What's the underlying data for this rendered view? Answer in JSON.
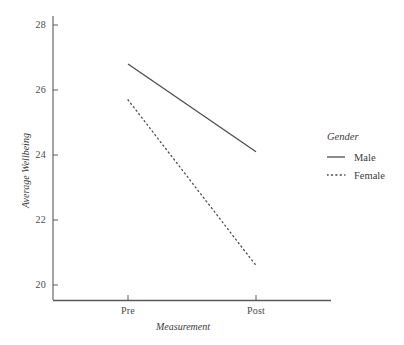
{
  "chart_data": {
    "type": "line",
    "title": "",
    "xlabel": "Measurement",
    "ylabel": "Average Wellbeing",
    "categories": [
      "Pre",
      "Post"
    ],
    "x_tick_labels": [
      "Pre",
      "Post"
    ],
    "y_tick_labels": [
      "20",
      "22",
      "24",
      "26",
      "28"
    ],
    "ylim": [
      19.6,
      28.4
    ],
    "yticks": [
      20,
      22,
      24,
      26,
      28
    ],
    "grid": false,
    "legend_position": "right",
    "legend_title": "Gender",
    "series": [
      {
        "name": "Male",
        "linestyle": "solid",
        "color": "#4d4d4d",
        "values": [
          26.8,
          24.1
        ]
      },
      {
        "name": "Female",
        "linestyle": "dotted",
        "color": "#4d4d4d",
        "values": [
          25.7,
          20.6
        ]
      }
    ]
  },
  "axes": {
    "y_label": "Average Wellbeing",
    "x_label": "Measurement",
    "y_ticks": [
      {
        "label": "28",
        "value": 28
      },
      {
        "label": "26",
        "value": 26
      },
      {
        "label": "24",
        "value": 24
      },
      {
        "label": "22",
        "value": 22
      },
      {
        "label": "20",
        "value": 20
      }
    ],
    "x_ticks": [
      {
        "label": "Pre",
        "value": 0
      },
      {
        "label": "Post",
        "value": 1
      }
    ]
  },
  "legend": {
    "title": "Gender",
    "entries": [
      {
        "label": "Male",
        "style": "solid"
      },
      {
        "label": "Female",
        "style": "dotted"
      }
    ]
  },
  "colors": {
    "line": "#4d4d4d",
    "axis": "#5a5a5a",
    "text": "#3c3c3c",
    "background": "#ffffff"
  }
}
